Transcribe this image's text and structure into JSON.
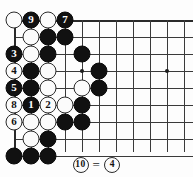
{
  "figure": {
    "type": "go-board-diagram",
    "title": "",
    "colors": {
      "black_stone": "#111111",
      "white_stone": "#fbfbfb",
      "stone_outline": "#2b2b2b",
      "grid_line": "#3a3a3a",
      "board_background": "#fdfdfd",
      "black_number_text": "#ffffff",
      "white_number_text": "#111111"
    }
  },
  "board": {
    "columns": 11,
    "rows": 9,
    "origin_x": 14,
    "origin_y": 20,
    "spacing": 17,
    "top_edge": true,
    "left_edge": true,
    "star_points": [
      {
        "col": 5,
        "row": 4
      },
      {
        "col": 10,
        "row": 4
      }
    ],
    "stones": [
      {
        "col": 1,
        "row": 1,
        "color": "white",
        "label": ""
      },
      {
        "col": 2,
        "row": 1,
        "color": "black",
        "label": "9"
      },
      {
        "col": 3,
        "row": 1,
        "color": "white",
        "label": ""
      },
      {
        "col": 4,
        "row": 1,
        "color": "black",
        "label": "7"
      },
      {
        "col": 2,
        "row": 2,
        "color": "white",
        "label": ""
      },
      {
        "col": 3,
        "row": 2,
        "color": "black",
        "label": ""
      },
      {
        "col": 4,
        "row": 2,
        "color": "black",
        "label": ""
      },
      {
        "col": 1,
        "row": 3,
        "color": "black",
        "label": "3"
      },
      {
        "col": 2,
        "row": 3,
        "color": "white",
        "label": ""
      },
      {
        "col": 3,
        "row": 3,
        "color": "black",
        "label": ""
      },
      {
        "col": 5,
        "row": 3,
        "color": "black",
        "label": ""
      },
      {
        "col": 1,
        "row": 4,
        "color": "white",
        "label": "4"
      },
      {
        "col": 2,
        "row": 4,
        "color": "black",
        "label": ""
      },
      {
        "col": 3,
        "row": 4,
        "color": "white",
        "label": ""
      },
      {
        "col": 6,
        "row": 4,
        "color": "black",
        "label": ""
      },
      {
        "col": 1,
        "row": 5,
        "color": "black",
        "label": "5"
      },
      {
        "col": 2,
        "row": 5,
        "color": "black",
        "label": ""
      },
      {
        "col": 3,
        "row": 5,
        "color": "white",
        "label": ""
      },
      {
        "col": 5,
        "row": 5,
        "color": "white",
        "label": ""
      },
      {
        "col": 6,
        "row": 5,
        "color": "black",
        "label": ""
      },
      {
        "col": 1,
        "row": 6,
        "color": "white",
        "label": "8"
      },
      {
        "col": 2,
        "row": 6,
        "color": "black",
        "label": "1"
      },
      {
        "col": 3,
        "row": 6,
        "color": "white",
        "label": "2"
      },
      {
        "col": 4,
        "row": 6,
        "color": "white",
        "label": ""
      },
      {
        "col": 5,
        "row": 6,
        "color": "black",
        "label": ""
      },
      {
        "col": 1,
        "row": 7,
        "color": "white",
        "label": "6"
      },
      {
        "col": 2,
        "row": 7,
        "color": "white",
        "label": ""
      },
      {
        "col": 3,
        "row": 7,
        "color": "white",
        "label": ""
      },
      {
        "col": 4,
        "row": 7,
        "color": "black",
        "label": ""
      },
      {
        "col": 5,
        "row": 7,
        "color": "black",
        "label": ""
      },
      {
        "col": 2,
        "row": 8,
        "color": "white",
        "label": ""
      },
      {
        "col": 3,
        "row": 8,
        "color": "black",
        "label": ""
      },
      {
        "col": 1,
        "row": 9,
        "color": "black",
        "label": ""
      },
      {
        "col": 2,
        "row": 9,
        "color": "black",
        "label": ""
      },
      {
        "col": 3,
        "row": 9,
        "color": "black",
        "label": ""
      }
    ]
  },
  "caption": {
    "left_move": "10",
    "equals": "=",
    "right_move": "4",
    "text": "10 = 4"
  }
}
